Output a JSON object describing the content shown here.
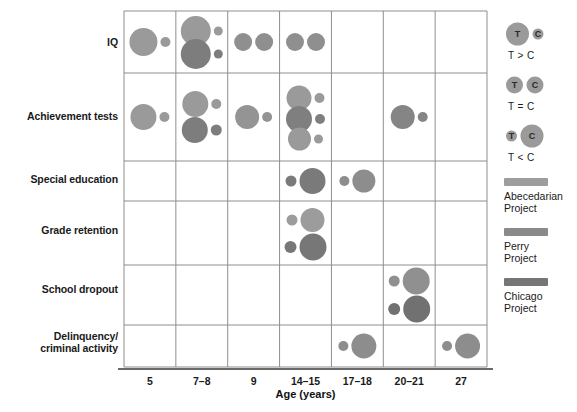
{
  "chart_data": {
    "type": "scatter",
    "title": "",
    "subtitle": "",
    "xlabel": "Age (years)",
    "ylabel": "",
    "grid": true,
    "legend_position": "right",
    "categories": [
      "5",
      "7–8",
      "9",
      "14–15",
      "17–18",
      "20–21",
      "27"
    ],
    "rows": [
      "IQ",
      "Achievement tests",
      "Special education",
      "Grade retention",
      "School dropout",
      "Delinquency/\ncriminal activity"
    ],
    "row_labels": [
      {
        "line1": "IQ",
        "line2": ""
      },
      {
        "line1": "Achievement tests",
        "line2": ""
      },
      {
        "line1": "Special education",
        "line2": ""
      },
      {
        "line1": "Grade retention",
        "line2": ""
      },
      {
        "line1": "School dropout",
        "line2": ""
      },
      {
        "line1": "Delinquency/",
        "line2": "criminal activity"
      }
    ],
    "series": [
      {
        "name": "Abecedarian Project",
        "color": "#9a9a9a"
      },
      {
        "name": "Perry Project",
        "color": "#8a8a8a"
      },
      {
        "name": "Chicago Project",
        "color": "#6e6e6e"
      }
    ],
    "bubble_meaning": {
      "T": "Treatment group",
      "C": "Control group",
      "encoding": "bubble area proportional to outcome magnitude; left bubble = T, right bubble = C"
    },
    "points": [
      {
        "row": "IQ",
        "age": "5",
        "project": "Abecedarian Project",
        "color": "#9a9a9a",
        "t_r": 14.0,
        "c_r": 5.0,
        "offset_y": 0,
        "relation": "T > C"
      },
      {
        "row": "IQ",
        "age": "7–8",
        "project": "Abecedarian Project",
        "color": "#9a9a9a",
        "t_r": 15.0,
        "c_r": 4.5,
        "offset_y": -11,
        "relation": "T > C"
      },
      {
        "row": "IQ",
        "age": "7–8",
        "project": "Perry Project",
        "color": "#7d7d7d",
        "t_r": 15.0,
        "c_r": 4.5,
        "offset_y": 12,
        "relation": "T > C"
      },
      {
        "row": "IQ",
        "age": "9",
        "project": "Perry Project",
        "color": "#8f8f8f",
        "t_r": 9.0,
        "c_r": 9.0,
        "offset_y": 0,
        "relation": "T = C"
      },
      {
        "row": "IQ",
        "age": "14–15",
        "project": "Perry Project",
        "color": "#8f8f8f",
        "t_r": 9.0,
        "c_r": 9.0,
        "offset_y": 0,
        "relation": "T = C"
      },
      {
        "row": "Achievement tests",
        "age": "5",
        "project": "Abecedarian Project",
        "color": "#9a9a9a",
        "t_r": 13.0,
        "c_r": 5.0,
        "offset_y": 0,
        "relation": "T > C"
      },
      {
        "row": "Achievement tests",
        "age": "7–8",
        "project": "Abecedarian Project",
        "color": "#9a9a9a",
        "t_r": 13.0,
        "c_r": 5.0,
        "offset_y": -13,
        "relation": "T > C"
      },
      {
        "row": "Achievement tests",
        "age": "7–8",
        "project": "Perry Project",
        "color": "#7d7d7d",
        "t_r": 13.0,
        "c_r": 5.5,
        "offset_y": 13,
        "relation": "T > C"
      },
      {
        "row": "Achievement tests",
        "age": "9",
        "project": "Abecedarian Project",
        "color": "#949494",
        "t_r": 12.0,
        "c_r": 5.0,
        "offset_y": 0,
        "relation": "T > C"
      },
      {
        "row": "Achievement tests",
        "age": "14–15",
        "project": "Abecedarian Project",
        "color": "#9a9a9a",
        "t_r": 12.5,
        "c_r": 5.0,
        "offset_y": -19,
        "relation": "T > C"
      },
      {
        "row": "Achievement tests",
        "age": "14–15",
        "project": "Perry Project",
        "color": "#7f7f7f",
        "t_r": 13.0,
        "c_r": 5.0,
        "offset_y": 2,
        "relation": "T > C"
      },
      {
        "row": "Achievement tests",
        "age": "14–15",
        "project": "Chicago Project",
        "color": "#9a9a9a",
        "t_r": 11.5,
        "c_r": 4.5,
        "offset_y": 22,
        "relation": "T > C"
      },
      {
        "row": "Achievement tests",
        "age": "20–21",
        "project": "Perry Project",
        "color": "#858585",
        "t_r": 12.0,
        "c_r": 5.0,
        "offset_y": 0,
        "relation": "T > C"
      },
      {
        "row": "Special education",
        "age": "14–15",
        "project": "Chicago Project",
        "color": "#7a7a7a",
        "t_r": 5.5,
        "c_r": 13.0,
        "offset_y": 0,
        "relation": "T < C"
      },
      {
        "row": "Special education",
        "age": "17–18",
        "project": "Perry Project",
        "color": "#8d8d8d",
        "t_r": 5.0,
        "c_r": 11.5,
        "offset_y": 0,
        "relation": "T < C"
      },
      {
        "row": "Grade retention",
        "age": "14–15",
        "project": "Abecedarian Project",
        "color": "#9c9c9c",
        "t_r": 5.5,
        "c_r": 12.0,
        "offset_y": -13,
        "relation": "T < C"
      },
      {
        "row": "Grade retention",
        "age": "14–15",
        "project": "Chicago Project",
        "color": "#777777",
        "t_r": 6.0,
        "c_r": 13.5,
        "offset_y": 14,
        "relation": "T < C"
      },
      {
        "row": "School dropout",
        "age": "20–21",
        "project": "Abecedarian Project",
        "color": "#909090",
        "t_r": 5.5,
        "c_r": 13.5,
        "offset_y": -14,
        "relation": "T < C"
      },
      {
        "row": "School dropout",
        "age": "20–21",
        "project": "Chicago Project",
        "color": "#717171",
        "t_r": 6.0,
        "c_r": 13.5,
        "offset_y": 14,
        "relation": "T < C"
      },
      {
        "row": "Delinquency/criminal activity",
        "age": "17–18",
        "project": "Perry Project",
        "color": "#8d8d8d",
        "t_r": 5.0,
        "c_r": 12.5,
        "offset_y": 0,
        "relation": "T < C"
      },
      {
        "row": "Delinquency/criminal activity",
        "age": "27",
        "project": "Perry Project",
        "color": "#8d8d8d",
        "t_r": 5.0,
        "c_r": 12.5,
        "offset_y": 0,
        "relation": "T < C"
      }
    ]
  },
  "axis": {
    "x_title": "Age (years)",
    "ticks": [
      "5",
      "7–8",
      "9",
      "14–15",
      "17–18",
      "20–21",
      "27"
    ]
  },
  "row_labels": [
    {
      "line1": "IQ",
      "line2": ""
    },
    {
      "line1": "Achievement tests",
      "line2": ""
    },
    {
      "line1": "Special education",
      "line2": ""
    },
    {
      "line1": "Grade retention",
      "line2": ""
    },
    {
      "line1": "School dropout",
      "line2": ""
    },
    {
      "line1": "Delinquency/",
      "line2": "criminal activity"
    }
  ],
  "legend": {
    "relations": [
      {
        "t_label": "T",
        "c_label": "C",
        "caption": "T > C",
        "t_r": 11.5,
        "c_r": 5.5,
        "color": "#9a9a9a"
      },
      {
        "t_label": "T",
        "c_label": "C",
        "caption": "T = C",
        "t_r": 8.5,
        "c_r": 8.5,
        "color": "#9a9a9a"
      },
      {
        "t_label": "T",
        "c_label": "C",
        "caption": "T < C",
        "t_r": 5.5,
        "c_r": 11.5,
        "color": "#9a9a9a"
      }
    ],
    "projects": [
      {
        "name_line1": "Abecedarian",
        "name_line2": "Project",
        "color": "#9d9d9d"
      },
      {
        "name_line1": "Perry",
        "name_line2": "Project",
        "color": "#8a8a8a"
      },
      {
        "name_line1": "Chicago",
        "name_line2": "Project",
        "color": "#767676"
      }
    ]
  },
  "colors": {
    "grid_line": "#8e8e8e",
    "axis_line": "#6a6a6a",
    "text": "#1a1a1a",
    "background": "#ffffff"
  }
}
